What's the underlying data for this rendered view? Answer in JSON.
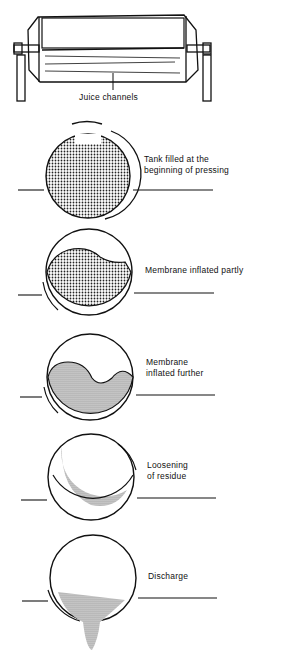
{
  "diagram": {
    "press_label": "Juice channels",
    "stages": [
      {
        "id": "stage-1",
        "line1": "Tank filled at the",
        "line2": "beginning of pressing"
      },
      {
        "id": "stage-2",
        "line1": "Membrane inflated partly",
        "line2": ""
      },
      {
        "id": "stage-3",
        "line1": "Membrane",
        "line2": "inflated further"
      },
      {
        "id": "stage-4",
        "line1": "Loosening",
        "line2": "of residue"
      },
      {
        "id": "stage-5",
        "line1": "Discharge",
        "line2": ""
      }
    ],
    "colors": {
      "ink": "#111111",
      "fill": "#888888",
      "background": "#ffffff"
    }
  }
}
